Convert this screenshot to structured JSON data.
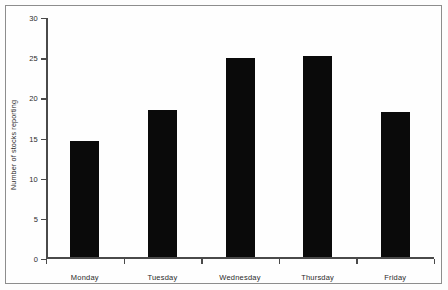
{
  "chart_data": {
    "type": "bar",
    "title": "",
    "xlabel": "",
    "ylabel": "Number of stocks reporting",
    "categories": [
      "Monday",
      "Tuesday",
      "Wednesday",
      "Thursday",
      "Friday"
    ],
    "values": [
      14.7,
      18.5,
      25.0,
      25.3,
      18.3
    ],
    "ylim": [
      0,
      30
    ],
    "yticks": [
      0,
      5,
      10,
      15,
      20,
      25,
      30
    ],
    "ytick_labels": [
      "0",
      "5",
      "10",
      "15",
      "20",
      "25",
      "30"
    ],
    "grid": false,
    "legend": null,
    "bar_color": "#0a0a0a",
    "axis_color": "#4a4a4a",
    "background_color": "#fefefe"
  }
}
